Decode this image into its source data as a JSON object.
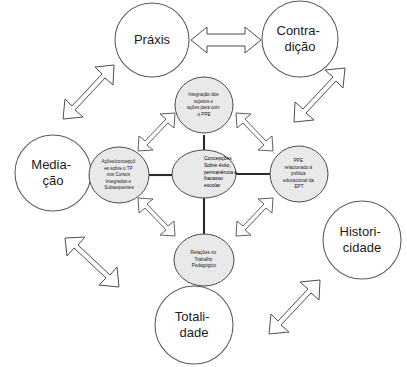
{
  "diagram": {
    "title": "Concepções sobre êxito, permanência e fracasso escolar",
    "type": "concept-map",
    "colors": {
      "inner_node_fill": "#e9e9e9",
      "inner_node_stroke": "#4a4a4a",
      "outer_node_fill": "#ffffff",
      "outer_node_stroke": "#5a5a5a",
      "connector": "#2a2a2a",
      "arrow_fill": "#ffffff",
      "arrow_stroke": "#4d4d4d",
      "background": "#ffffff",
      "text": "#1b1b1b"
    },
    "center_node": {
      "id": "center",
      "lines": [
        "Concepções",
        "Sobre êxito,",
        "permanência e",
        "fracasso",
        "escolar"
      ]
    },
    "inner_nodes": [
      {
        "id": "top",
        "position": "top",
        "lines": [
          "Integração dos",
          "sujeitos  e",
          "ações para com",
          "o PPE"
        ]
      },
      {
        "id": "left",
        "position": "left",
        "lines": [
          "Ações/concepçõ",
          "es sobre o TP",
          "nos Cursos",
          "Integrados e",
          "Subsequentes"
        ]
      },
      {
        "id": "right",
        "position": "right",
        "lines": [
          "PPE",
          "relacionado à",
          "política",
          "educacional da",
          "EPT"
        ]
      },
      {
        "id": "bottom",
        "position": "bottom",
        "lines": [
          "Relações no",
          "Trabalho",
          "Pedagógico"
        ]
      }
    ],
    "outer_nodes": [
      {
        "id": "praxis",
        "position": "top-left",
        "lines": [
          "Práxis"
        ]
      },
      {
        "id": "contradicao",
        "position": "top-right",
        "lines": [
          "Contra-",
          "dição"
        ]
      },
      {
        "id": "mediacao",
        "position": "left",
        "lines": [
          "Media-",
          "ção"
        ]
      },
      {
        "id": "historicidade",
        "position": "right",
        "lines": [
          "Histori-",
          "cidade"
        ]
      },
      {
        "id": "totalidade",
        "position": "bottom",
        "lines": [
          "Totali-",
          "dade"
        ]
      }
    ],
    "connectors": [
      {
        "from": "center",
        "to": "top",
        "style": "line"
      },
      {
        "from": "center",
        "to": "left",
        "style": "line"
      },
      {
        "from": "center",
        "to": "right",
        "style": "line"
      },
      {
        "from": "center",
        "to": "bottom",
        "style": "line"
      }
    ],
    "arrows": [
      {
        "id": "arrow-top-horizontal",
        "kind": "double-headed-block",
        "orientation": "horizontal",
        "between": [
          "praxis",
          "contradicao"
        ]
      },
      {
        "id": "arrow-upper-left",
        "kind": "double-headed-block",
        "orientation": "diagonal-ne-sw",
        "between": [
          "praxis",
          "left"
        ]
      },
      {
        "id": "arrow-upper-right",
        "kind": "double-headed-block",
        "orientation": "diagonal-nw-se",
        "between": [
          "contradicao",
          "right"
        ]
      },
      {
        "id": "arrow-lower-left",
        "kind": "double-headed-block",
        "orientation": "diagonal-nw-se",
        "between": [
          "mediacao",
          "bottom"
        ]
      },
      {
        "id": "arrow-lower-right",
        "kind": "double-headed-block",
        "orientation": "diagonal-ne-sw",
        "between": [
          "historicidade",
          "totalidade"
        ]
      },
      {
        "id": "arrow-inner-top-left",
        "kind": "double-headed-block",
        "orientation": "diagonal-ne-sw",
        "between": [
          "top",
          "left"
        ]
      },
      {
        "id": "arrow-inner-top-right",
        "kind": "double-headed-block",
        "orientation": "diagonal-nw-se",
        "between": [
          "top",
          "right"
        ]
      },
      {
        "id": "arrow-inner-bottom-left",
        "kind": "double-headed-block",
        "orientation": "diagonal-nw-se",
        "between": [
          "left",
          "bottom"
        ]
      },
      {
        "id": "arrow-inner-bottom-right",
        "kind": "double-headed-block",
        "orientation": "diagonal-ne-sw",
        "between": [
          "bottom",
          "right"
        ]
      }
    ]
  }
}
